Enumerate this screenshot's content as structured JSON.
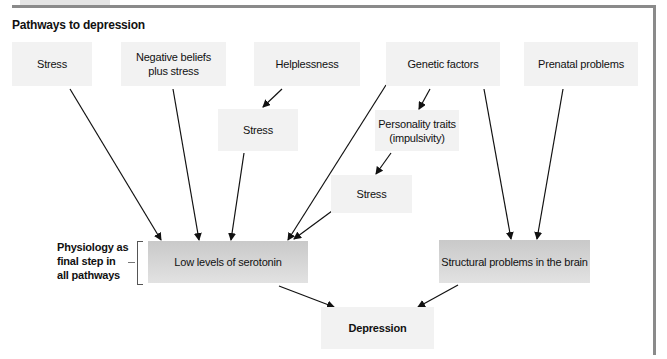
{
  "figure": {
    "title": "Pathways to depression",
    "side_label_lines": [
      "Physiology as",
      "final step in",
      "all pathways"
    ]
  },
  "nodes": {
    "stress_top": "Stress",
    "negative_beliefs": "Negative beliefs plus stress",
    "helplessness": "Helplessness",
    "genetic_factors": "Genetic factors",
    "prenatal_problems": "Prenatal problems",
    "stress_mid": "Stress",
    "personality_traits_line1": "Personality traits",
    "personality_traits_line2": "(impulsivity)",
    "stress_lower": "Stress",
    "low_serotonin": "Low levels of serotonin",
    "structural_problems": "Structural problems in the brain",
    "depression": "Depression"
  },
  "edges": [
    {
      "from": "Stress",
      "to": "Low levels of serotonin"
    },
    {
      "from": "Negative beliefs plus stress",
      "to": "Low levels of serotonin"
    },
    {
      "from": "Helplessness",
      "to": "Stress (middle)"
    },
    {
      "from": "Stress (middle)",
      "to": "Low levels of serotonin"
    },
    {
      "from": "Genetic factors",
      "to": "Low levels of serotonin"
    },
    {
      "from": "Genetic factors",
      "to": "Personality traits (impulsivity)"
    },
    {
      "from": "Genetic factors",
      "to": "Structural problems in the brain"
    },
    {
      "from": "Personality traits (impulsivity)",
      "to": "Stress (lower)"
    },
    {
      "from": "Stress (lower)",
      "to": "Low levels of serotonin"
    },
    {
      "from": "Prenatal problems",
      "to": "Structural problems in the brain"
    },
    {
      "from": "Low levels of serotonin",
      "to": "Depression"
    },
    {
      "from": "Structural problems in the brain",
      "to": "Depression"
    }
  ],
  "colors": {
    "frame": "#8a8a8a",
    "box_light": "#f2f2f2",
    "box_dark_top": "#c9c9c9",
    "box_dark_bottom": "#e2e2e2",
    "arrow": "#111111"
  }
}
